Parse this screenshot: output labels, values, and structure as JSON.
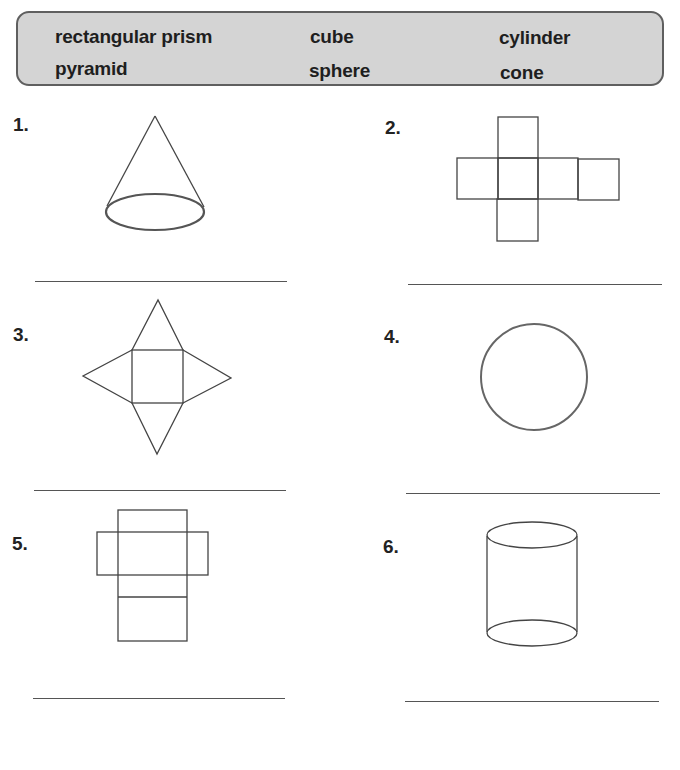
{
  "word_bank": {
    "words": [
      "rectangular prism",
      "cube",
      "cylinder",
      "pyramid",
      "sphere",
      "cone"
    ],
    "fill_color": "#d4d4d4",
    "border_color": "#5f5f5f"
  },
  "problems": [
    {
      "number": "1.",
      "figure": "cone-drawing",
      "answer": ""
    },
    {
      "number": "2.",
      "figure": "cube-net",
      "answer": ""
    },
    {
      "number": "3.",
      "figure": "square-pyramid-net",
      "answer": ""
    },
    {
      "number": "4.",
      "figure": "sphere-circle",
      "answer": ""
    },
    {
      "number": "5.",
      "figure": "rectangular-prism-net",
      "answer": ""
    },
    {
      "number": "6.",
      "figure": "cylinder-drawing",
      "answer": ""
    }
  ]
}
